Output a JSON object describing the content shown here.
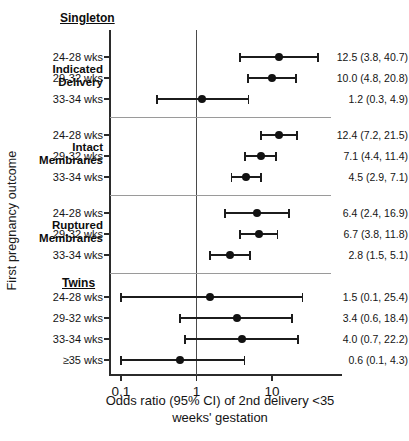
{
  "axes": {
    "y_title": "First pregnancy outcome",
    "x_caption_line1": "Odds ratio (95% CI) of 2nd delivery <35",
    "x_caption_line2": "weeks' gestation",
    "x_ticks": [
      "0.1",
      "1",
      "10"
    ],
    "x_tick_values": [
      0.1,
      1,
      10
    ],
    "reference_line": 1
  },
  "sections": [
    {
      "label": "Singleton"
    },
    {
      "label": "Twins"
    }
  ],
  "groups": [
    {
      "label_line1": "Indicated",
      "label_line2": "Delivery"
    },
    {
      "label_line1": "Intact",
      "label_line2": "Membranes"
    },
    {
      "label_line1": "Ruptured",
      "label_line2": "Membranes"
    }
  ],
  "chart_data": {
    "type": "scatter",
    "title": "",
    "xlabel": "Odds ratio (95% CI) of 2nd delivery <35 weeks' gestation",
    "ylabel": "First pregnancy outcome",
    "xscale": "log",
    "xlim": [
      0.07,
      55
    ],
    "xticks": [
      0.1,
      1,
      10
    ],
    "grid": false,
    "legend": "none",
    "reference_line_x": 1,
    "rows": [
      {
        "section": "Singleton",
        "group": "Indicated Delivery",
        "category": "24-28 wks",
        "or": 12.5,
        "lo": 3.8,
        "hi": 40.7,
        "value_label": "12.5 (3.8, 40.7)"
      },
      {
        "section": "Singleton",
        "group": "Indicated Delivery",
        "category": "29-32 wks",
        "or": 10.0,
        "lo": 4.8,
        "hi": 20.8,
        "value_label": "10.0 (4.8, 20.8)"
      },
      {
        "section": "Singleton",
        "group": "Indicated Delivery",
        "category": "33-34 wks",
        "or": 1.2,
        "lo": 0.3,
        "hi": 4.9,
        "value_label": "1.2 (0.3, 4.9)"
      },
      {
        "section": "Singleton",
        "group": "Intact Membranes",
        "category": "24-28 wks",
        "or": 12.4,
        "lo": 7.2,
        "hi": 21.5,
        "value_label": "12.4 (7.2, 21.5)"
      },
      {
        "section": "Singleton",
        "group": "Intact Membranes",
        "category": "29-32 wks",
        "or": 7.1,
        "lo": 4.4,
        "hi": 11.4,
        "value_label": "7.1 (4.4, 11.4)"
      },
      {
        "section": "Singleton",
        "group": "Intact Membranes",
        "category": "33-34 wks",
        "or": 4.5,
        "lo": 2.9,
        "hi": 7.1,
        "value_label": "4.5 (2.9, 7.1)"
      },
      {
        "section": "Singleton",
        "group": "Ruptured Membranes",
        "category": "24-28 wks",
        "or": 6.4,
        "lo": 2.4,
        "hi": 16.9,
        "value_label": "6.4 (2.4, 16.9)"
      },
      {
        "section": "Singleton",
        "group": "Ruptured Membranes",
        "category": "29-32 wks",
        "or": 6.7,
        "lo": 3.8,
        "hi": 11.8,
        "value_label": "6.7 (3.8, 11.8)"
      },
      {
        "section": "Singleton",
        "group": "Ruptured Membranes",
        "category": "33-34 wks",
        "or": 2.8,
        "lo": 1.5,
        "hi": 5.1,
        "value_label": "2.8 (1.5, 5.1)"
      },
      {
        "section": "Twins",
        "group": "",
        "category": "24-28 wks",
        "or": 1.5,
        "lo": 0.1,
        "hi": 25.4,
        "value_label": "1.5 (0.1, 25.4)"
      },
      {
        "section": "Twins",
        "group": "",
        "category": "29-32 wks",
        "or": 3.4,
        "lo": 0.6,
        "hi": 18.4,
        "value_label": "3.4 (0.6, 18.4)"
      },
      {
        "section": "Twins",
        "group": "",
        "category": "33-34 wks",
        "or": 4.0,
        "lo": 0.7,
        "hi": 22.2,
        "value_label": "4.0 (0.7, 22.2)"
      },
      {
        "section": "Twins",
        "group": "",
        "category": "≥35 wks",
        "or": 0.6,
        "lo": 0.1,
        "hi": 4.3,
        "value_label": "0.6 (0.1, 4.3)"
      }
    ]
  },
  "colors": {
    "marker": "#121212",
    "axis": "#2b2b2b",
    "separator": "#9a9a9a",
    "reference": "#4a4a4a"
  }
}
